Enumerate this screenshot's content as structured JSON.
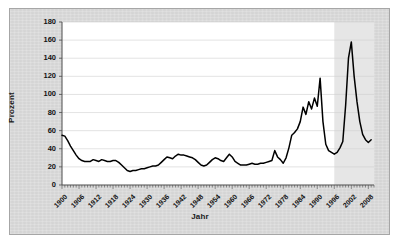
{
  "chart_data": {
    "type": "line",
    "title": "",
    "xlabel": "Jahr",
    "ylabel": "Prozent",
    "xlim": [
      1900,
      2010
    ],
    "ylim": [
      0,
      180
    ],
    "ytick_step": 20,
    "xtick_step": 6,
    "grid": "horizontal",
    "legend": "none",
    "yticks": [
      "180",
      "160",
      "140",
      "120",
      "100",
      "80",
      "60",
      "40",
      "20",
      "0"
    ],
    "xticks": [
      "1900",
      "1906",
      "1912",
      "1918",
      "1924",
      "1930",
      "1936",
      "1942",
      "1948",
      "1954",
      "1960",
      "1966",
      "1972",
      "1978",
      "1984",
      "1990",
      "1996",
      "2002",
      "2008"
    ],
    "series": [
      {
        "name": "Prozent",
        "color": "#000000",
        "x": [
          1900,
          1901,
          1902,
          1903,
          1904,
          1905,
          1906,
          1907,
          1908,
          1909,
          1910,
          1911,
          1912,
          1913,
          1914,
          1915,
          1916,
          1917,
          1918,
          1919,
          1920,
          1921,
          1922,
          1923,
          1924,
          1925,
          1926,
          1927,
          1928,
          1929,
          1930,
          1931,
          1932,
          1933,
          1934,
          1935,
          1936,
          1937,
          1938,
          1939,
          1940,
          1941,
          1942,
          1943,
          1944,
          1945,
          1946,
          1947,
          1948,
          1949,
          1950,
          1951,
          1952,
          1953,
          1954,
          1955,
          1956,
          1957,
          1958,
          1959,
          1960,
          1961,
          1962,
          1963,
          1964,
          1965,
          1966,
          1967,
          1968,
          1969,
          1970,
          1971,
          1972,
          1973,
          1974,
          1975,
          1976,
          1977,
          1978,
          1979,
          1980,
          1981,
          1982,
          1983,
          1984,
          1985,
          1986,
          1987,
          1988,
          1989,
          1990,
          1991,
          1992,
          1993,
          1994,
          1995,
          1996,
          1997,
          1998,
          1999,
          2000,
          2001,
          2002,
          2003,
          2004,
          2005,
          2006,
          2007,
          2008,
          2009
        ],
        "y": [
          55,
          54,
          49,
          43,
          38,
          33,
          29,
          27,
          26,
          26,
          26,
          28,
          27,
          26,
          28,
          27,
          26,
          26,
          27,
          27,
          25,
          22,
          19,
          16,
          15,
          16,
          16,
          17,
          18,
          18,
          19,
          20,
          21,
          21,
          22,
          25,
          28,
          31,
          30,
          29,
          32,
          34,
          33,
          33,
          32,
          31,
          30,
          28,
          25,
          22,
          21,
          22,
          25,
          28,
          30,
          29,
          27,
          26,
          30,
          34,
          31,
          26,
          24,
          22,
          22,
          22,
          23,
          24,
          23,
          23,
          24,
          24,
          25,
          26,
          27,
          38,
          31,
          28,
          24,
          30,
          41,
          55,
          58,
          62,
          70,
          86,
          78,
          92,
          84,
          96,
          87,
          118,
          70,
          45,
          38,
          36,
          34,
          36,
          41,
          48,
          88,
          140,
          158,
          120,
          92,
          70,
          56,
          50,
          47,
          50
        ],
        "shaded_region": {
          "from": 1996,
          "to": 2010,
          "color": "#e6e6e6"
        }
      }
    ]
  },
  "axes": {
    "y_title": "Prozent",
    "x_title": "Jahr"
  },
  "colors": {
    "canvas": "#d9d9d9",
    "plot_background": "#ffffff",
    "projection_band": "#e6e6e6",
    "line": "#000000",
    "gridline": "#d0d0d0",
    "frame_border": "#a6a6a6"
  }
}
